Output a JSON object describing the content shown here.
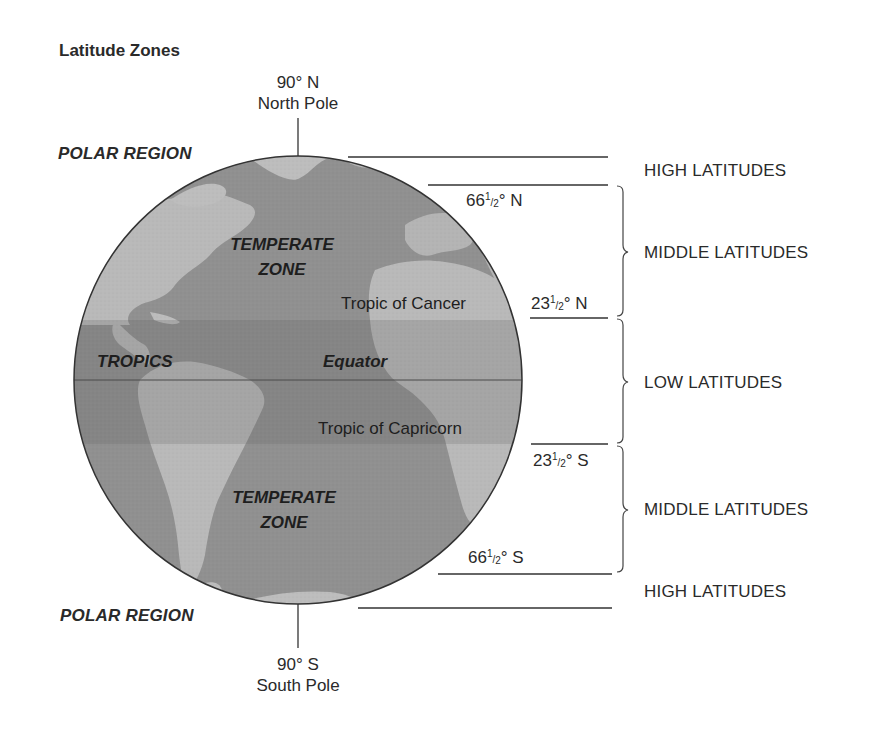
{
  "title": "Latitude Zones",
  "poles": {
    "north": {
      "degree": "90° N",
      "name": "North Pole"
    },
    "south": {
      "degree": "90° S",
      "name": "South Pole"
    }
  },
  "regions": {
    "polar_north": "POLAR REGION",
    "polar_south": "POLAR REGION",
    "temperate_north": [
      "TEMPERATE",
      "ZONE"
    ],
    "temperate_south": [
      "TEMPERATE",
      "ZONE"
    ],
    "tropics": "TROPICS",
    "equator": "Equator"
  },
  "tropic_lines": {
    "cancer": "Tropic of Cancer",
    "capricorn": "Tropic of Capricorn"
  },
  "degree_marks": [
    {
      "id": "arctic_circle",
      "whole": "66",
      "num": "1",
      "den": "2",
      "suffix": "° N"
    },
    {
      "id": "tropic_cancer",
      "whole": "23",
      "num": "1",
      "den": "2",
      "suffix": "° N"
    },
    {
      "id": "tropic_capricorn",
      "whole": "23",
      "num": "1",
      "den": "2",
      "suffix": "° S"
    },
    {
      "id": "antarctic_circle",
      "whole": "66",
      "num": "1",
      "den": "2",
      "suffix": "° S"
    }
  ],
  "latitude_groups": [
    {
      "label": "HIGH LATITUDES",
      "range": "66½° N – 90° N"
    },
    {
      "label": "MIDDLE LATITUDES",
      "range": "23½° N – 66½° N"
    },
    {
      "label": "LOW LATITUDES",
      "range": "23½° S – 23½° N"
    },
    {
      "label": "MIDDLE LATITUDES",
      "range": "23½° S – 66½° S"
    },
    {
      "label": "HIGH LATITUDES",
      "range": "66½° S – 90° S"
    }
  ],
  "colors": {
    "ocean": "#8f8f8f",
    "land": "#b9b9b9",
    "tropics_band": "#7c7c7c",
    "tropics_land": "#a2a2a2",
    "outline": "#333333",
    "text": "#2a2a2a"
  }
}
